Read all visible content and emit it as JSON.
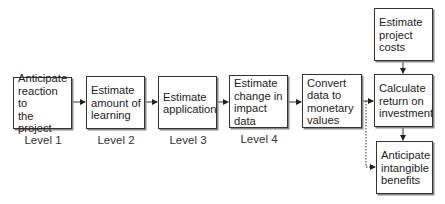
{
  "diagram": {
    "boxes": [
      {
        "id": "anticipate-reaction",
        "label": "Anticipate\nreaction to\nthe project"
      },
      {
        "id": "estimate-learning",
        "label": "Estimate\namount of\nlearning"
      },
      {
        "id": "estimate-application",
        "label": "Estimate\napplication"
      },
      {
        "id": "estimate-impact",
        "label": "Estimate\nchange in\nimpact data"
      },
      {
        "id": "convert-monetary",
        "label": "Convert\ndata to\nmonetary\nvalues"
      },
      {
        "id": "estimate-costs",
        "label": "Estimate\nproject\ncosts"
      },
      {
        "id": "calculate-roi",
        "label": "Calculate\nreturn on\ninvestment"
      },
      {
        "id": "anticipate-intangible",
        "label": "Anticipate\nintangible\nbenefits"
      }
    ],
    "levels": [
      "Level 1",
      "Level 2",
      "Level 3",
      "Level 4"
    ],
    "edges": [
      {
        "from": "anticipate-reaction",
        "to": "estimate-learning",
        "style": "solid"
      },
      {
        "from": "estimate-learning",
        "to": "estimate-application",
        "style": "solid"
      },
      {
        "from": "estimate-application",
        "to": "estimate-impact",
        "style": "solid"
      },
      {
        "from": "estimate-impact",
        "to": "convert-monetary",
        "style": "solid"
      },
      {
        "from": "convert-monetary",
        "to": "calculate-roi",
        "style": "solid"
      },
      {
        "from": "estimate-costs",
        "to": "calculate-roi",
        "style": "solid"
      },
      {
        "from": "calculate-roi",
        "to": "anticipate-intangible",
        "style": "solid"
      },
      {
        "from": "convert-monetary",
        "to": "anticipate-intangible",
        "style": "dotted"
      }
    ]
  }
}
